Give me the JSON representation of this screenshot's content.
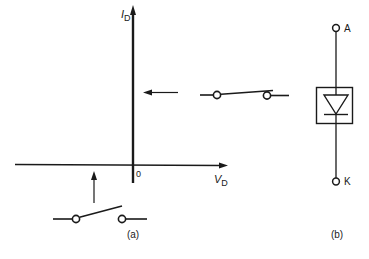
{
  "figure_a": {
    "caption": "(a)",
    "y_axis": {
      "label_main": "I",
      "label_sub": "D"
    },
    "x_axis": {
      "label_main": "V",
      "label_sub": "D"
    },
    "origin_label": "0",
    "closed_switch": {
      "state": "closed",
      "annotation": "on-state (vertical branch)"
    },
    "open_switch": {
      "state": "open",
      "annotation": "off-state (horizontal branch)"
    }
  },
  "figure_b": {
    "caption": "(b)",
    "anode_label": "A",
    "cathode_label": "K",
    "symbol": "diode-in-box"
  },
  "colors": {
    "ink": "#1a1a1a",
    "background": "#ffffff"
  }
}
